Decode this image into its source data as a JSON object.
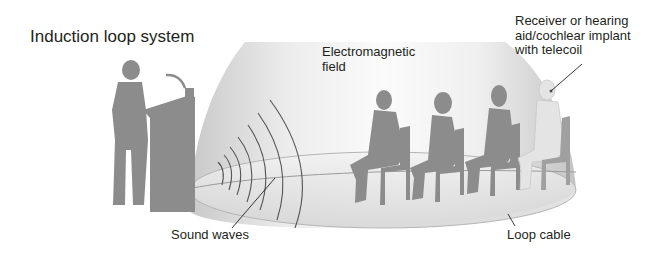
{
  "title": "Induction loop system",
  "labels": {
    "electromagnetic_field": [
      "Electromagnetic",
      "field"
    ],
    "receiver": [
      "Receiver or hearing",
      "aid/cochlear implant",
      "with telecoil"
    ],
    "sound_waves": "Sound waves",
    "loop_cable": "Loop cable"
  },
  "elements": {
    "speaker": "speaker-at-podium-icon",
    "microphone": "microphone-icon",
    "dome": "electromagnetic-field-dome",
    "audience": [
      "seated-man-icon",
      "seated-woman-icon",
      "seated-person-icon",
      "seated-person-with-hearing-aid-icon"
    ]
  },
  "colors": {
    "text": "#231f20",
    "silhouette": "#8c8c8c",
    "highlight_person": "#e4e4e4",
    "dome_light": "#fafafa",
    "dome_shade": "#cfcfcf",
    "leader_line": "#231f20"
  }
}
